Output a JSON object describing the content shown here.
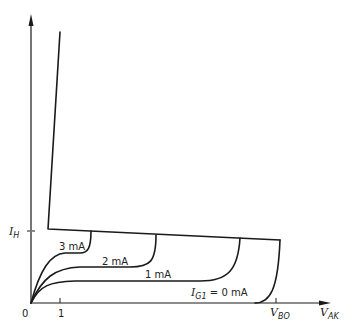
{
  "diagram": {
    "axes": {
      "y_label": "I_H",
      "y_label_main": "I",
      "y_label_sub": "H",
      "x_label_main": "V",
      "x_label_sub": "AK",
      "origin": "0",
      "x_tick_1": "1",
      "x_tick_vbo_main": "V",
      "x_tick_vbo_sub": "BO"
    },
    "curves": [
      {
        "label": "3 mA",
        "gate_current_ma": 3
      },
      {
        "label": "2 mA",
        "gate_current_ma": 2
      },
      {
        "label": "1 mA",
        "gate_current_ma": 1
      },
      {
        "label_main": "I",
        "label_sub": "G1",
        "label_tail": " = 0 mA",
        "gate_current_ma": 0
      }
    ]
  }
}
